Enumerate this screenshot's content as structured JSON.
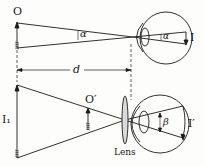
{
  "labels": {
    "object": "O",
    "image": "I",
    "alpha": "α",
    "alpha_eye": "α",
    "distance": "d",
    "virtual_image": "I₁",
    "object_prime": "O′",
    "lens": "Lens",
    "beta": "β",
    "image_prime": "I′"
  },
  "colors": {
    "ink": "#1a1a1a",
    "background": "#fdfdfb"
  }
}
